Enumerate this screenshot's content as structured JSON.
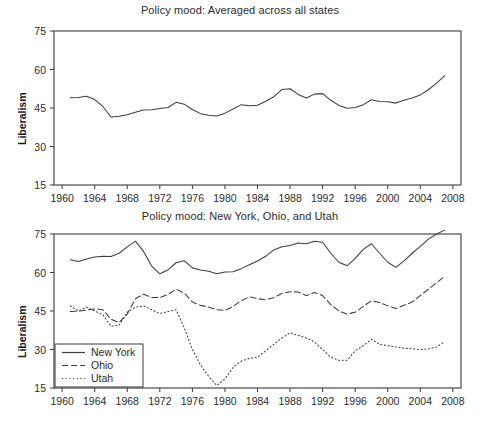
{
  "chart_data": [
    {
      "type": "line",
      "panel": "top",
      "title": "Policy mood: Averaged across all states",
      "xlabel": "",
      "ylabel": "Liberalism",
      "xlim": [
        1959,
        2009
      ],
      "ylim": [
        15,
        75
      ],
      "grid": false,
      "legend_position": "none",
      "xticks": [
        1960,
        1964,
        1968,
        1972,
        1976,
        1980,
        1984,
        1988,
        1992,
        1996,
        2000,
        2004,
        2008
      ],
      "yticks": [
        15,
        30,
        45,
        60,
        75
      ],
      "series": [
        {
          "name": "All states average",
          "style": "solid",
          "x": [
            1961,
            1962,
            1963,
            1964,
            1965,
            1966,
            1967,
            1968,
            1969,
            1970,
            1971,
            1972,
            1973,
            1974,
            1975,
            1976,
            1977,
            1978,
            1979,
            1980,
            1981,
            1982,
            1983,
            1984,
            1985,
            1986,
            1987,
            1988,
            1989,
            1990,
            1991,
            1992,
            1993,
            1994,
            1995,
            1996,
            1997,
            1998,
            1999,
            2000,
            2001,
            2002,
            2003,
            2004,
            2005,
            2006,
            2007
          ],
          "values": [
            49.0,
            49.1,
            49.6,
            48.3,
            45.6,
            41.5,
            41.8,
            42.4,
            43.3,
            44.2,
            44.3,
            44.8,
            45.2,
            47.2,
            46.5,
            44.4,
            42.8,
            42.2,
            41.9,
            43.0,
            44.6,
            46.3,
            45.9,
            46.1,
            47.6,
            49.4,
            52.2,
            52.5,
            50.3,
            48.9,
            50.4,
            50.6,
            48.0,
            46.0,
            44.9,
            45.2,
            46.3,
            48.2,
            47.5,
            47.4,
            46.9,
            48.0,
            48.9,
            50.1,
            52.1,
            54.7,
            57.6
          ]
        }
      ]
    },
    {
      "type": "line",
      "panel": "bottom",
      "title": "Policy mood: New York, Ohio, and Utah",
      "xlabel": "",
      "ylabel": "Liberalism",
      "xlim": [
        1959,
        2009
      ],
      "ylim": [
        15,
        75
      ],
      "grid": false,
      "legend_position": "lower-left",
      "xticks": [
        1960,
        1964,
        1968,
        1972,
        1976,
        1980,
        1984,
        1988,
        1992,
        1996,
        2000,
        2004,
        2008
      ],
      "yticks": [
        15,
        30,
        45,
        60,
        75
      ],
      "series": [
        {
          "name": "New York",
          "style": "solid",
          "x": [
            1961,
            1962,
            1963,
            1964,
            1965,
            1966,
            1967,
            1968,
            1969,
            1970,
            1971,
            1972,
            1973,
            1974,
            1975,
            1976,
            1977,
            1978,
            1979,
            1980,
            1981,
            1982,
            1983,
            1984,
            1985,
            1986,
            1987,
            1988,
            1989,
            1990,
            1991,
            1992,
            1993,
            1994,
            1995,
            1996,
            1997,
            1998,
            1999,
            2000,
            2001,
            2002,
            2003,
            2004,
            2005,
            2006,
            2007
          ],
          "values": [
            65.0,
            64.3,
            65.3,
            66.0,
            66.3,
            66.2,
            67.5,
            70.0,
            72.2,
            68.2,
            62.5,
            59.5,
            61.0,
            63.8,
            64.6,
            61.8,
            61.0,
            60.5,
            59.5,
            60.2,
            60.3,
            61.5,
            63.0,
            64.5,
            66.3,
            68.8,
            70.0,
            70.5,
            71.5,
            71.2,
            72.2,
            71.8,
            67.5,
            64.0,
            62.6,
            65.5,
            69.0,
            71.2,
            67.5,
            64.0,
            62.0,
            64.5,
            67.5,
            70.2,
            73.0,
            75.0,
            76.5
          ]
        },
        {
          "name": "Ohio",
          "style": "dashed",
          "x": [
            1961,
            1962,
            1963,
            1964,
            1965,
            1966,
            1967,
            1968,
            1969,
            1970,
            1971,
            1972,
            1973,
            1974,
            1975,
            1976,
            1977,
            1978,
            1979,
            1980,
            1981,
            1982,
            1983,
            1984,
            1985,
            1986,
            1987,
            1988,
            1989,
            1990,
            1991,
            1992,
            1993,
            1994,
            1995,
            1996,
            1997,
            1998,
            1999,
            2000,
            2001,
            2002,
            2003,
            2004,
            2005,
            2006,
            2007
          ],
          "values": [
            44.8,
            44.9,
            45.4,
            45.8,
            45.5,
            41.8,
            40.5,
            43.8,
            49.8,
            51.5,
            50.3,
            50.2,
            51.5,
            53.5,
            52.0,
            48.5,
            47.2,
            46.5,
            45.5,
            45.2,
            46.8,
            49.0,
            50.5,
            49.8,
            49.4,
            50.2,
            51.8,
            52.5,
            52.4,
            51.0,
            52.2,
            51.0,
            47.5,
            45.0,
            43.8,
            44.5,
            46.8,
            49.0,
            48.3,
            47.0,
            46.0,
            47.2,
            48.5,
            51.0,
            53.5,
            56.0,
            58.5
          ]
        },
        {
          "name": "Utah",
          "style": "dotted",
          "x": [
            1961,
            1962,
            1963,
            1964,
            1965,
            1966,
            1967,
            1968,
            1969,
            1970,
            1971,
            1972,
            1973,
            1974,
            1975,
            1976,
            1977,
            1978,
            1979,
            1980,
            1981,
            1982,
            1983,
            1984,
            1985,
            1986,
            1987,
            1988,
            1989,
            1990,
            1991,
            1992,
            1993,
            1994,
            1995,
            1996,
            1997,
            1998,
            1999,
            2000,
            2001,
            2002,
            2003,
            2004,
            2005,
            2006,
            2007
          ],
          "values": [
            47.0,
            45.0,
            46.5,
            45.0,
            43.5,
            39.0,
            39.5,
            44.5,
            46.5,
            47.0,
            45.5,
            44.0,
            44.8,
            45.5,
            38.5,
            30.0,
            24.0,
            19.5,
            16.0,
            18.5,
            23.0,
            25.5,
            26.5,
            27.0,
            29.5,
            32.0,
            34.5,
            36.5,
            35.5,
            34.5,
            33.0,
            30.0,
            27.0,
            25.8,
            25.8,
            29.5,
            31.5,
            34.0,
            32.0,
            31.5,
            31.0,
            30.5,
            30.3,
            30.0,
            30.2,
            31.0,
            33.0
          ]
        }
      ]
    }
  ]
}
